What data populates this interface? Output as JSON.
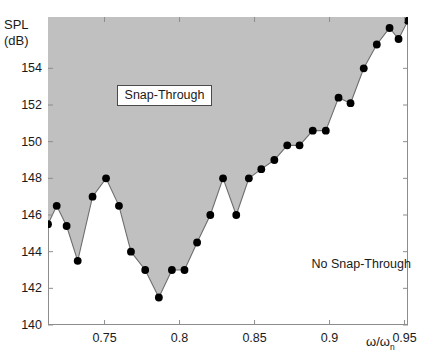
{
  "chart_data": {
    "type": "line",
    "title": "",
    "xlabel": "ω/ω",
    "xlabel_sub": "n",
    "ylabel_line1": "SPL",
    "ylabel_line2": "(dB)",
    "xlim": [
      0.7123,
      0.9523
    ],
    "ylim": [
      140,
      156.8
    ],
    "xticks": [
      0.75,
      0.8,
      0.85,
      0.9,
      0.95
    ],
    "xticklabels": [
      "0.75",
      "0.8",
      "0.85",
      "0.9",
      "0.95"
    ],
    "yticks": [
      140,
      142,
      144,
      146,
      148,
      150,
      152,
      154
    ],
    "yticklabels": [
      "140",
      "142",
      "144",
      "146",
      "148",
      "150",
      "152",
      "154"
    ],
    "grid": false,
    "legend_position": "none",
    "fill_color": "#c0c0c0",
    "line_color": "#6e6e6e",
    "marker_color": "#000000",
    "fill_above": true,
    "series": [
      {
        "name": "Snap-Through threshold",
        "x": [
          0.7123,
          0.7181,
          0.7247,
          0.7321,
          0.742,
          0.751,
          0.7596,
          0.7676,
          0.7771,
          0.7862,
          0.7949,
          0.8033,
          0.8117,
          0.8205,
          0.829,
          0.8378,
          0.8462,
          0.8545,
          0.8632,
          0.8718,
          0.88,
          0.8888,
          0.8975,
          0.906,
          0.914,
          0.9228,
          0.9315,
          0.94,
          0.946,
          0.9523
        ],
        "y": [
          145.5,
          146.5,
          145.4,
          143.5,
          147.0,
          148.0,
          146.5,
          144.0,
          143.0,
          141.5,
          143.0,
          143.0,
          144.5,
          146.0,
          148.0,
          146.0,
          148.0,
          148.5,
          149.0,
          149.8,
          149.8,
          150.6,
          150.6,
          152.4,
          152.1,
          154.0,
          155.3,
          156.2,
          155.6,
          156.6
        ]
      }
    ],
    "annotations": [
      {
        "text": "Snap-Through",
        "boxed": true,
        "x": 0.758,
        "y": 152.6
      },
      {
        "text": "No Snap-Through",
        "boxed": false,
        "x": 0.888,
        "y": 143.2
      }
    ]
  }
}
